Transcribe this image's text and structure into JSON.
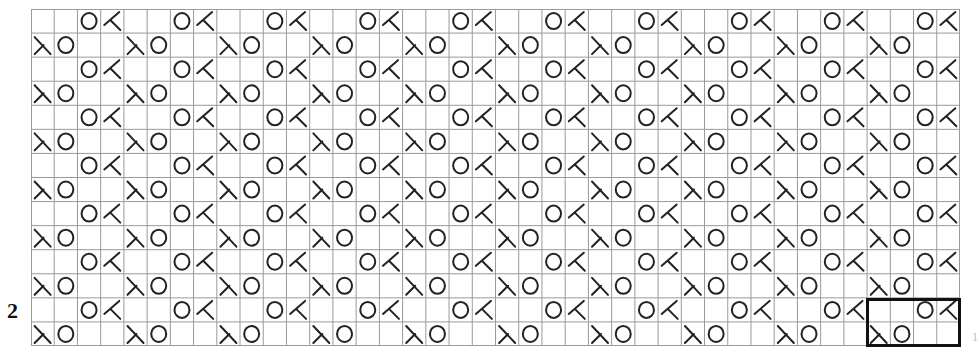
{
  "chart": {
    "columns": 40,
    "rows": 14,
    "row_pattern_odd_from_top": [
      "",
      "",
      "yo",
      "ssk"
    ],
    "row_pattern_even_from_top": [
      "k2tog",
      "yo",
      "",
      ""
    ],
    "symbols": {
      "yo": "O",
      "ssk": "left-leaning decrease",
      "k2tog": "right-leaning decrease"
    },
    "grid_color": "#9a9a9a",
    "symbol_color": "#222222"
  },
  "labels": {
    "row_label": "2",
    "right_edge_mark": "1"
  },
  "repeat_box": {
    "columns": 4,
    "rows": 2,
    "position": "bottom-right"
  }
}
